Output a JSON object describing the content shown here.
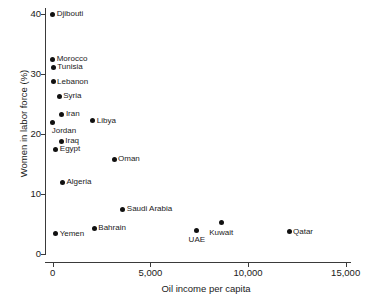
{
  "chart_data": {
    "type": "scatter",
    "title": "",
    "xlabel": "Oil income per capita",
    "ylabel": "Women in labor force (%)",
    "xlim": [
      0,
      15600
    ],
    "ylim": [
      -0.7,
      41.5
    ],
    "grid": false,
    "legend": "none",
    "xticks": [
      {
        "value": 0,
        "label": "0"
      },
      {
        "value": 5000,
        "label": "5,000"
      },
      {
        "value": 10000,
        "label": "10,000"
      },
      {
        "value": 15000,
        "label": "15,000"
      }
    ],
    "yticks": [
      {
        "value": 0,
        "label": "0"
      },
      {
        "value": 10,
        "label": "10"
      },
      {
        "value": 20,
        "label": "20"
      },
      {
        "value": 30,
        "label": "30"
      },
      {
        "value": 40,
        "label": "40"
      }
    ],
    "points": [
      {
        "name": "Djibouti",
        "x": 0,
        "y": 40.0,
        "label_pos": "right"
      },
      {
        "name": "Morocco",
        "x": 0,
        "y": 32.5,
        "label_pos": "right"
      },
      {
        "name": "Tunisia",
        "x": 30,
        "y": 31.1,
        "label_pos": "right"
      },
      {
        "name": "Lebanon",
        "x": 20,
        "y": 28.7,
        "label_pos": "right"
      },
      {
        "name": "Syria",
        "x": 330,
        "y": 26.3,
        "label_pos": "right"
      },
      {
        "name": "Iran",
        "x": 470,
        "y": 23.3,
        "label_pos": "right"
      },
      {
        "name": "Jordan",
        "x": 0,
        "y": 22.0,
        "label_pos": "below-right"
      },
      {
        "name": "Libya",
        "x": 2050,
        "y": 22.2,
        "label_pos": "right"
      },
      {
        "name": "Iraq",
        "x": 440,
        "y": 18.8,
        "label_pos": "right"
      },
      {
        "name": "Egypt",
        "x": 160,
        "y": 17.5,
        "label_pos": "right"
      },
      {
        "name": "Oman",
        "x": 3140,
        "y": 15.8,
        "label_pos": "right"
      },
      {
        "name": "Algeria",
        "x": 500,
        "y": 12.0,
        "label_pos": "right"
      },
      {
        "name": "Saudi Arabia",
        "x": 3590,
        "y": 7.5,
        "label_pos": "right"
      },
      {
        "name": "Bahrain",
        "x": 2130,
        "y": 4.3,
        "label_pos": "right"
      },
      {
        "name": "Yemen",
        "x": 150,
        "y": 3.4,
        "label_pos": "right"
      },
      {
        "name": "Kuwait",
        "x": 8630,
        "y": 5.2,
        "label_pos": "below"
      },
      {
        "name": "UAE",
        "x": 7380,
        "y": 4.0,
        "label_pos": "below"
      },
      {
        "name": "Qatar",
        "x": 12100,
        "y": 3.7,
        "label_pos": "right"
      }
    ]
  }
}
